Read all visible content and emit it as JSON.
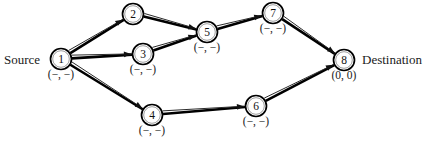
{
  "diagram": {
    "source_label": "Source",
    "destination_label": "Destination",
    "colors": {
      "background": "#ffffff",
      "node_stroke": "#000000",
      "edge_thick": "#000000",
      "edge_thin": "#2b2b2b",
      "text": "#1a1a1a"
    },
    "nodes": [
      {
        "id": "1",
        "x": 61,
        "y": 59,
        "r": 10.5,
        "tag": "(−, −)",
        "tag_x": 61,
        "tag_y": 78,
        "role": "source"
      },
      {
        "id": "2",
        "x": 133,
        "y": 14,
        "r": 10.5,
        "tag": "",
        "tag_x": 133,
        "tag_y": 33,
        "role": "intermediate"
      },
      {
        "id": "3",
        "x": 143,
        "y": 54,
        "r": 10.5,
        "tag": "(−, −)",
        "tag_x": 143,
        "tag_y": 73,
        "role": "intermediate"
      },
      {
        "id": "4",
        "x": 152,
        "y": 115,
        "r": 10.5,
        "tag": "(−, −)",
        "tag_x": 152,
        "tag_y": 134,
        "role": "intermediate"
      },
      {
        "id": "5",
        "x": 207,
        "y": 32,
        "r": 10.5,
        "tag": "(−, −)",
        "tag_x": 207,
        "tag_y": 51,
        "role": "intermediate"
      },
      {
        "id": "6",
        "x": 256,
        "y": 106,
        "r": 10.5,
        "tag": "(−, −)",
        "tag_x": 256,
        "tag_y": 125,
        "role": "intermediate"
      },
      {
        "id": "7",
        "x": 273,
        "y": 13,
        "r": 10.5,
        "tag": "(−, −)",
        "tag_x": 273,
        "tag_y": 32,
        "role": "intermediate"
      },
      {
        "id": "8",
        "x": 344,
        "y": 60,
        "r": 10.5,
        "tag": "(0, 0)",
        "tag_x": 344,
        "tag_y": 79,
        "role": "destination"
      }
    ],
    "edges": [
      {
        "name": "edge-1-2",
        "from": "1",
        "to": "2",
        "arrow": true
      },
      {
        "name": "edge-1-3",
        "from": "1",
        "to": "3",
        "arrow": true
      },
      {
        "name": "edge-1-4",
        "from": "1",
        "to": "4",
        "arrow": true
      },
      {
        "name": "edge-2-5",
        "from": "2",
        "to": "5",
        "arrow": true
      },
      {
        "name": "edge-3-5",
        "from": "3",
        "to": "5",
        "arrow": true
      },
      {
        "name": "edge-5-7",
        "from": "5",
        "to": "7",
        "arrow": true
      },
      {
        "name": "edge-7-8",
        "from": "7",
        "to": "8",
        "arrow": true
      },
      {
        "name": "edge-4-6",
        "from": "4",
        "to": "6",
        "arrow": true
      },
      {
        "name": "edge-6-8",
        "from": "6",
        "to": "8",
        "arrow": true
      }
    ]
  }
}
